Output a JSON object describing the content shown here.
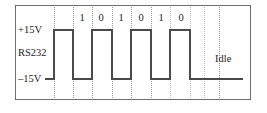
{
  "figure": {
    "frame": {
      "x": 15,
      "y": 5,
      "width": 236,
      "height": 95
    }
  },
  "axis": {
    "high_label": "+15V",
    "signal_label": "RS232",
    "low_label": "–15V",
    "high_y": 30,
    "low_y": 79
  },
  "annotations": {
    "idle_label": "Idle",
    "idle_x": 215,
    "idle_y": 53
  },
  "bits": [
    {
      "value": "1",
      "x": 82
    },
    {
      "value": "0",
      "x": 101
    },
    {
      "value": "1",
      "x": 121
    },
    {
      "value": "0",
      "x": 141
    },
    {
      "value": "1",
      "x": 161
    },
    {
      "value": "0",
      "x": 181
    }
  ],
  "gridlines": [
    {
      "x": 54,
      "strong": true
    },
    {
      "x": 73,
      "strong": true
    },
    {
      "x": 92,
      "strong": true
    },
    {
      "x": 112,
      "strong": true
    },
    {
      "x": 131,
      "strong": true
    },
    {
      "x": 151,
      "strong": true
    },
    {
      "x": 170,
      "strong": false
    },
    {
      "x": 190,
      "strong": false
    },
    {
      "x": 204,
      "strong": false
    },
    {
      "x": 219,
      "strong": true
    }
  ],
  "chart_data": {
    "type": "line",
    "xlabel": "",
    "ylabel": "RS232",
    "ytick_labels": [
      "+15V",
      "–15V"
    ],
    "ylim": [
      -15,
      15
    ],
    "grid": true,
    "legend": null,
    "annotations": [
      "Idle"
    ],
    "bit_sequence": [
      "1",
      "0",
      "1",
      "0",
      "1",
      "0"
    ],
    "level_volts": {
      "high": 15,
      "low": -15
    },
    "note": "RS232 uses inverted logic: a '1' bit is drawn at the +15V level and a '0' bit at the -15V level; line rests at -15V during Idle.",
    "series": [
      {
        "name": "RS232 line voltage",
        "points": [
          {
            "x": 45,
            "v": -15
          },
          {
            "x": 54,
            "v": -15
          },
          {
            "x": 54,
            "v": 15
          },
          {
            "x": 73,
            "v": 15
          },
          {
            "x": 73,
            "v": -15
          },
          {
            "x": 92,
            "v": -15
          },
          {
            "x": 92,
            "v": 15
          },
          {
            "x": 112,
            "v": 15
          },
          {
            "x": 112,
            "v": -15
          },
          {
            "x": 131,
            "v": -15
          },
          {
            "x": 131,
            "v": 15
          },
          {
            "x": 151,
            "v": 15
          },
          {
            "x": 151,
            "v": -15
          },
          {
            "x": 170,
            "v": -15
          },
          {
            "x": 170,
            "v": 15
          },
          {
            "x": 190,
            "v": 15
          },
          {
            "x": 190,
            "v": -15
          },
          {
            "x": 243,
            "v": -15
          }
        ]
      }
    ]
  }
}
